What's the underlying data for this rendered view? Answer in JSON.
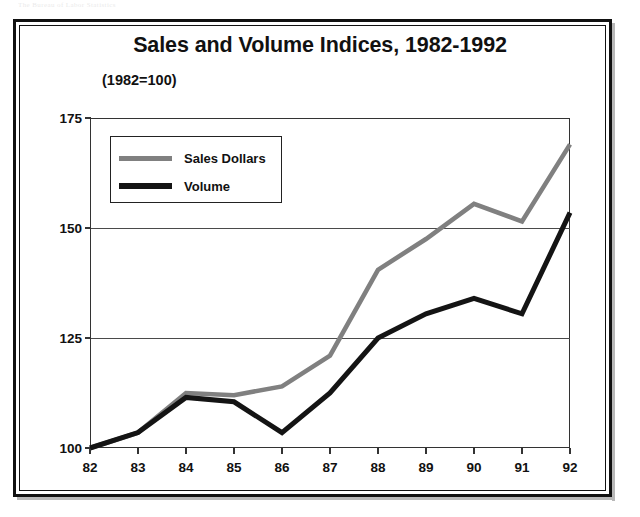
{
  "scan_artifact": "The Bureau of Labor Statistics",
  "figure": {
    "title": "Sales and Volume Indices, 1982-1992",
    "subtitle": "(1982=100)"
  },
  "legend": {
    "position": "upper-left-inside",
    "entries": [
      {
        "label": "Sales Dollars",
        "color": "#808080",
        "icon": "line-swatch-gray"
      },
      {
        "label": "Volume",
        "color": "#141414",
        "icon": "line-swatch-black"
      }
    ]
  },
  "colors": {
    "sales_dollars": "#808080",
    "volume": "#141414",
    "axis": "#333333",
    "grid": "#4a4a4a",
    "frame": "#111111",
    "background": "#ffffff"
  },
  "chart_data": {
    "type": "line",
    "title": "Sales and Volume Indices, 1982-1992",
    "subtitle": "(1982=100)",
    "xlabel": "",
    "ylabel": "",
    "x": [
      82,
      83,
      84,
      85,
      86,
      87,
      88,
      89,
      90,
      91,
      92
    ],
    "categories": [
      "82",
      "83",
      "84",
      "85",
      "86",
      "87",
      "88",
      "89",
      "90",
      "91",
      "92"
    ],
    "xtick_labels": [
      "82",
      "83",
      "84",
      "85",
      "86",
      "87",
      "88",
      "89",
      "90",
      "91",
      "92"
    ],
    "ytick_labels": [
      "100",
      "125",
      "150",
      "175"
    ],
    "yticks": [
      100,
      125,
      150,
      175
    ],
    "ylim": [
      100,
      175
    ],
    "xlim": [
      82,
      92
    ],
    "grid": true,
    "grid_axis": "y",
    "legend_position": "upper left",
    "series": [
      {
        "name": "Sales Dollars",
        "color": "#808080",
        "values": [
          100,
          103.5,
          112.5,
          112,
          114,
          121,
          140.5,
          147.5,
          155.5,
          151.5,
          169
        ]
      },
      {
        "name": "Volume",
        "color": "#141414",
        "values": [
          100,
          103.5,
          111.5,
          110.5,
          103.5,
          112.5,
          125,
          130.5,
          134,
          130.5,
          153.5
        ]
      }
    ]
  }
}
